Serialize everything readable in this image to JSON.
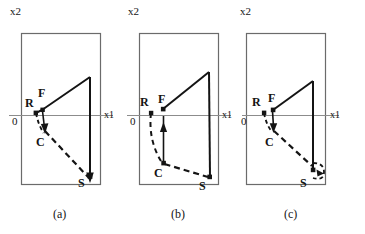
{
  "figure": {
    "width": 365,
    "height": 234,
    "background": "#ffffff",
    "stroke_color": "#141414",
    "axis_color": "#8c8c8c",
    "frame_color": "#6b6b6b"
  },
  "panels": [
    {
      "id": "a",
      "caption": "(a)",
      "axis_label_x": "x1",
      "axis_label_y": "x2",
      "origin_label": "0",
      "nodes": [
        {
          "name": "R",
          "label": "R"
        },
        {
          "name": "F",
          "label": "F"
        },
        {
          "name": "C",
          "label": "C"
        },
        {
          "name": "S",
          "label": "S"
        }
      ]
    },
    {
      "id": "b",
      "caption": "(b)",
      "axis_label_x": "x1",
      "axis_label_y": "x2",
      "origin_label": "0",
      "nodes": [
        {
          "name": "R",
          "label": "R"
        },
        {
          "name": "F",
          "label": "F"
        },
        {
          "name": "C",
          "label": "C"
        },
        {
          "name": "S",
          "label": "S"
        }
      ]
    },
    {
      "id": "c",
      "caption": "(c)",
      "axis_label_x": "x1",
      "axis_label_y": "x2",
      "origin_label": "0",
      "nodes": [
        {
          "name": "R",
          "label": "R"
        },
        {
          "name": "F",
          "label": "F"
        },
        {
          "name": "C",
          "label": "C"
        },
        {
          "name": "S",
          "label": "S"
        }
      ]
    }
  ]
}
